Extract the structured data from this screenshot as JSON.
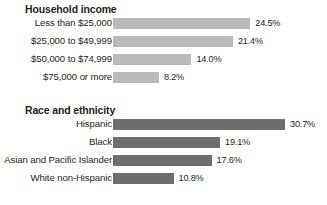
{
  "chart_data": {
    "type": "bar",
    "title": "",
    "orientation": "horizontal",
    "xlabel": "",
    "ylabel": "",
    "xlim": [
      0,
      35
    ],
    "grid": false,
    "legend": null,
    "panels": [
      {
        "title": "Household income",
        "bar_color": "#b9b9b9",
        "categories": [
          "Less than $25,000",
          "$25,000 to $49,999",
          "$50,000 to $74,999",
          "$75,000 or more"
        ],
        "values": [
          24.5,
          21.4,
          14.0,
          8.2
        ],
        "value_labels": [
          "24.5%",
          "21.4%",
          "14.0%",
          "8.2%"
        ]
      },
      {
        "title": "Race and ethnicity",
        "bar_color": "#6e6e6e",
        "categories": [
          "Hispanic",
          "Black",
          "Asian and Pacific Islander",
          "White non-Hispanic"
        ],
        "values": [
          30.7,
          19.1,
          17.6,
          10.8
        ],
        "value_labels": [
          "30.7%",
          "19.1%",
          "17.6%",
          "10.8%"
        ]
      }
    ]
  },
  "colors": {
    "text": "#231f20",
    "bar_light": "#b9b9b9",
    "bar_dark": "#6e6e6e",
    "background": "#ffffff"
  }
}
